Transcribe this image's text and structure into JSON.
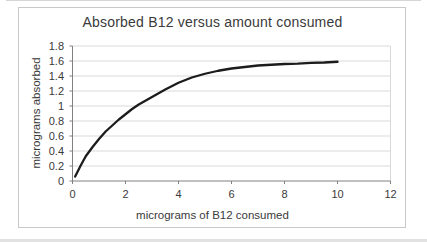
{
  "chart_data": {
    "type": "line",
    "title": "Absorbed B12 versus amount consumed",
    "xlabel": "micrograms of B12 consumed",
    "ylabel": "micrograms absorbed",
    "xlim": [
      0,
      12
    ],
    "ylim": [
      0,
      1.8
    ],
    "x_tick_values": [
      0,
      2,
      4,
      6,
      8,
      10,
      12
    ],
    "x_tick_labels": [
      "0",
      "2",
      "4",
      "6",
      "8",
      "10",
      "12"
    ],
    "y_tick_values": [
      0,
      0.2,
      0.4,
      0.6,
      0.8,
      1,
      1.2,
      1.4,
      1.6,
      1.8
    ],
    "y_tick_labels": [
      "0",
      "0.2",
      "0.4",
      "0.6",
      "0.8",
      "1",
      "1.2",
      "1.4",
      "1.6",
      "1.8"
    ],
    "grid": "horizontal-only",
    "legend": "none",
    "series": [
      {
        "name": "absorbed-b12",
        "color": "#1c1c1c",
        "points": [
          [
            0.1,
            0.06
          ],
          [
            0.3,
            0.2
          ],
          [
            0.5,
            0.33
          ],
          [
            0.75,
            0.45
          ],
          [
            1,
            0.56
          ],
          [
            1.25,
            0.66
          ],
          [
            1.5,
            0.74
          ],
          [
            1.75,
            0.82
          ],
          [
            2,
            0.89
          ],
          [
            2.25,
            0.96
          ],
          [
            2.5,
            1.02
          ],
          [
            3,
            1.12
          ],
          [
            3.5,
            1.22
          ],
          [
            4,
            1.31
          ],
          [
            4.5,
            1.38
          ],
          [
            5,
            1.43
          ],
          [
            5.5,
            1.47
          ],
          [
            6,
            1.5
          ],
          [
            6.5,
            1.52
          ],
          [
            7,
            1.54
          ],
          [
            7.5,
            1.55
          ],
          [
            8,
            1.56
          ],
          [
            8.5,
            1.565
          ],
          [
            9,
            1.575
          ],
          [
            9.5,
            1.58
          ],
          [
            10,
            1.59
          ]
        ]
      }
    ],
    "colors": {
      "background": "#ffffff",
      "frame_border": "#c9c9c9",
      "gridline": "#d9d9d9",
      "axis": "#808080",
      "text": "#3a3a3a",
      "curve": "#1c1c1c"
    }
  }
}
